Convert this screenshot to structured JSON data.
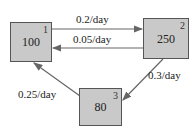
{
  "diagram": {
    "type": "compartment-flow",
    "compartments": [
      {
        "id": "1",
        "value": "100"
      },
      {
        "id": "2",
        "value": "250"
      },
      {
        "id": "3",
        "value": "80"
      }
    ],
    "flows": [
      {
        "from": "1",
        "to": "2",
        "rate": "0.2/day"
      },
      {
        "from": "2",
        "to": "1",
        "rate": "0.05/day"
      },
      {
        "from": "2",
        "to": "3",
        "rate": "0.3/day"
      },
      {
        "from": "3",
        "to": "1",
        "rate": "0.25/day"
      }
    ]
  },
  "colors": {
    "box_fill": "#c9c9c9",
    "box_border": "#555555",
    "arrow": "#666666"
  }
}
